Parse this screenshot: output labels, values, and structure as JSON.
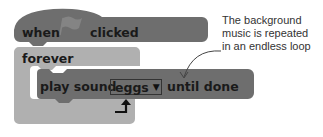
{
  "hat_block": {
    "word1": "when",
    "word2": "clicked",
    "icon": "green-flag-icon",
    "color": "#6e6e6e"
  },
  "forever_block": {
    "label": "forever",
    "color": "#b0b0b0",
    "loop_icon": "loop-arrow-icon"
  },
  "sound_block": {
    "label_before": "play sound",
    "dropdown_value": "eggs",
    "label_after": "until done",
    "color": "#6e6e6e"
  },
  "annotation": {
    "lines": [
      "The background",
      "music is repeated",
      "in an endless loop"
    ]
  }
}
